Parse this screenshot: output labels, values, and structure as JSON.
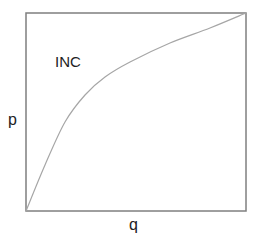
{
  "diagram": {
    "region_label": "INC",
    "y_axis_label": "p",
    "x_axis_label": "q",
    "colors": {
      "frame": "#7f7f7f",
      "curve": "#a6a6a6",
      "text": "#222222",
      "background": "#ffffff"
    },
    "frame": {
      "x": 26,
      "y": 13,
      "width": 220,
      "height": 198
    },
    "curve_points": [
      [
        26,
        211
      ],
      [
        45,
        165
      ],
      [
        65,
        122
      ],
      [
        85,
        95
      ],
      [
        105,
        77
      ],
      [
        130,
        62
      ],
      [
        170,
        43
      ],
      [
        210,
        28
      ],
      [
        246,
        13
      ]
    ]
  },
  "chart_data": {
    "type": "line",
    "title": "",
    "xlabel": "q",
    "ylabel": "p",
    "annotations": [
      "INC"
    ],
    "grid": false,
    "xlim": [
      0,
      1
    ],
    "ylim": [
      0,
      1
    ],
    "series": [
      {
        "name": "boundary curve",
        "x": [
          0.0,
          0.09,
          0.18,
          0.27,
          0.36,
          0.47,
          0.65,
          0.84,
          1.0
        ],
        "y": [
          0.0,
          0.23,
          0.45,
          0.59,
          0.68,
          0.75,
          0.85,
          0.92,
          1.0
        ]
      }
    ]
  }
}
